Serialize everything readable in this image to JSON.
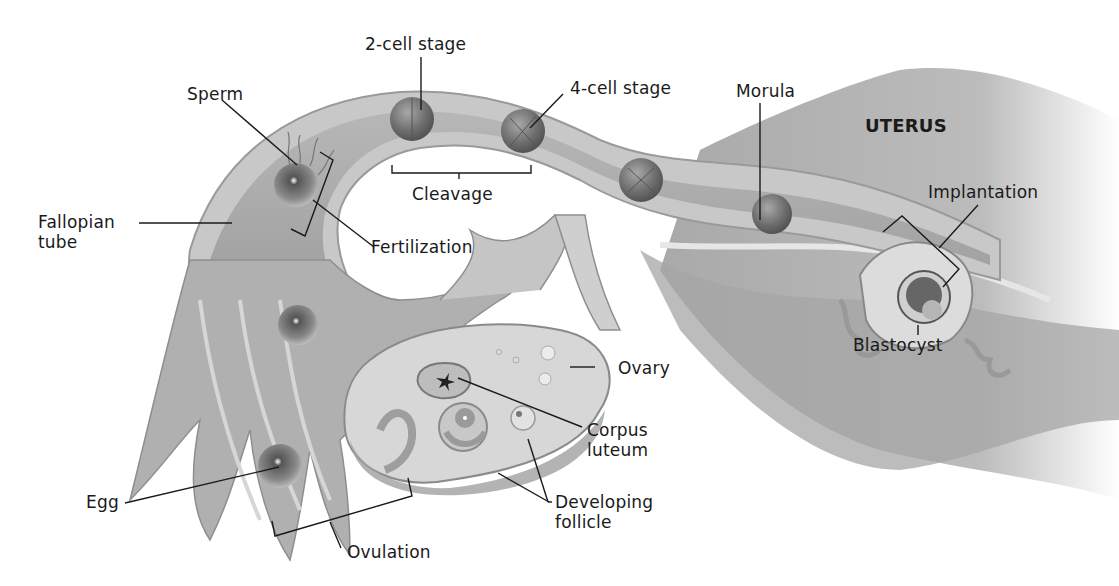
{
  "diagram": {
    "title_region": "UTERUS",
    "labels": {
      "two_cell": "2-cell stage",
      "four_cell": "4-cell stage",
      "morula": "Morula",
      "uterus": "UTERUS",
      "sperm": "Sperm",
      "cleavage": "Cleavage",
      "implantation": "Implantation",
      "fallopian_1": "Fallopian",
      "fallopian_2": "tube",
      "fertilization": "Fertilization",
      "blastocyst": "Blastocyst",
      "ovary": "Ovary",
      "corpus_1": "Corpus",
      "corpus_2": "luteum",
      "egg": "Egg",
      "developing_1": "Developing",
      "developing_2": "follicle",
      "ovulation": "Ovulation"
    },
    "colors": {
      "tissue_light": "#d9d9d9",
      "tissue_mid": "#b8b8b8",
      "tissue_dark": "#8c8c8c",
      "cell": "#7a7a7a",
      "line": "#1a1a1a"
    }
  }
}
